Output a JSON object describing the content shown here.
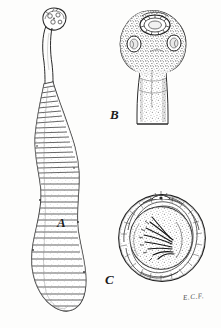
{
  "plate": {
    "background_color": "#fdfdfc",
    "ink_color": "#1c1c1c",
    "width": 221,
    "height": 328,
    "style": "engraving",
    "subject": "tapeworm anatomy plate"
  },
  "figures": [
    {
      "key": "A",
      "label": "A",
      "name": "whole-worm",
      "description": "entire segmented tapeworm with scolex, neck and proglottid chain",
      "label_position": {
        "x": 57,
        "y": 216
      }
    },
    {
      "key": "B",
      "label": "B",
      "name": "scolex-enlarged",
      "description": "enlarged stippled scolex showing rostellum and suckers on a neck",
      "label_position": {
        "x": 110,
        "y": 108
      }
    },
    {
      "key": "C",
      "label": "C",
      "name": "egg-section",
      "description": "circular egg with striated shell enclosing a hooked oncosphere",
      "label_position": {
        "x": 105,
        "y": 273
      }
    }
  ],
  "signature": {
    "text": "E.C.F.",
    "name": "artist-initials",
    "position": {
      "x": 183,
      "y": 293
    }
  }
}
